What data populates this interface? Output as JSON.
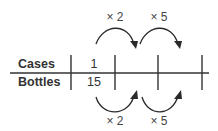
{
  "diagram": {
    "type": "ratio-table",
    "rows": [
      {
        "label": "Cases",
        "values": [
          "1",
          "",
          "",
          ""
        ]
      },
      {
        "label": "Bottles",
        "values": [
          "15",
          "",
          "",
          ""
        ]
      }
    ],
    "top_operations": [
      {
        "label": "× 2",
        "from_column": 1,
        "to_column": 2
      },
      {
        "label": "× 5",
        "from_column": 2,
        "to_column": 3
      }
    ],
    "bottom_operations": [
      {
        "label": "× 2",
        "from_column": 1,
        "to_column": 2
      },
      {
        "label": "× 5",
        "from_column": 2,
        "to_column": 3
      }
    ],
    "colors": {
      "text": "#333333",
      "lines": "#333333",
      "background": "#ffffff"
    }
  }
}
